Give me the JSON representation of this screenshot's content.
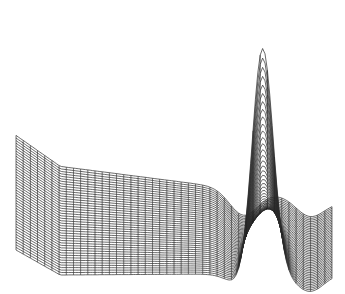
{
  "chart_data": {
    "type": "surface-wireframe",
    "title": "",
    "xlabel": "",
    "ylabel": "",
    "zlabel": "",
    "axes_visible": false,
    "grid": false,
    "legend": null,
    "mesh": {
      "rows": 44,
      "cols": 44
    },
    "features": [
      {
        "name": "peak",
        "screen_top": [
          275,
          12
        ],
        "relative_height": 1.0
      },
      {
        "name": "trough-left",
        "screen_center": [
          228,
          190
        ]
      },
      {
        "name": "trough-right",
        "screen_center": [
          312,
          228
        ]
      }
    ],
    "outline_screen": {
      "left_top": [
        16,
        181
      ],
      "top_corner": [
        183,
        125
      ],
      "left_bottom": [
        16,
        250
      ],
      "bottom_left": [
        60,
        275
      ],
      "bottom_right": [
        332,
        273
      ],
      "right_top": [
        332,
        212
      ]
    },
    "line_color": "#2a2a2a",
    "background": "#ffffff"
  }
}
